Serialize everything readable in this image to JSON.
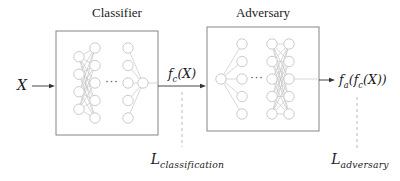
{
  "figure": {
    "classifier": {
      "title": "Classifier",
      "dots": "···",
      "layers": [
        4,
        5,
        5,
        1
      ]
    },
    "adversary": {
      "title": "Adversary",
      "dots": "···",
      "layers": [
        1,
        5,
        5,
        5
      ]
    },
    "labels": {
      "input": "X",
      "classifier_output": {
        "f": "f",
        "sub": "c",
        "args": "(X)"
      },
      "adversary_output": {
        "f": "f",
        "sub": "a",
        "mid": "(f",
        "sub2": "c",
        "args": "(X))"
      },
      "loss_classification": {
        "base": "L",
        "sub": "classification"
      },
      "loss_adversary": {
        "base": "L",
        "sub": "adversary"
      }
    },
    "colors": {
      "background": "#ffffff",
      "box_border": "#858585",
      "node_stroke": "#cccccc",
      "edge": "#c6c6c6",
      "arrow": "#333333",
      "dashed_line": "#b2b2b2",
      "text": "#1b1b1b"
    }
  }
}
